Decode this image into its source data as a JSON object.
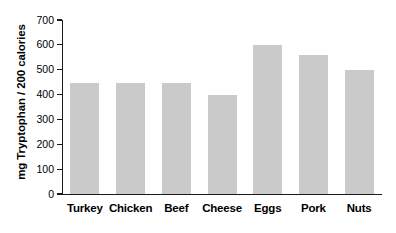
{
  "chart_data": {
    "type": "bar",
    "title": "",
    "xlabel": "",
    "ylabel": "mg Tryptophan / 200 calories",
    "categories": [
      "Turkey",
      "Chicken",
      "Beef",
      "Cheese",
      "Eggs",
      "Pork",
      "Nuts"
    ],
    "values": [
      445,
      445,
      445,
      400,
      600,
      560,
      500
    ],
    "ylim": [
      0,
      700
    ],
    "ytick_labels": [
      "700",
      "600",
      "500",
      "400",
      "300",
      "200",
      "100",
      "0"
    ],
    "ytick_values": [
      700,
      600,
      500,
      400,
      300,
      200,
      100,
      0
    ],
    "grid": false,
    "legend": false,
    "bar_color": "#cacaca",
    "axis_color": "#1a1a1a",
    "background_color": "#ffffff"
  }
}
